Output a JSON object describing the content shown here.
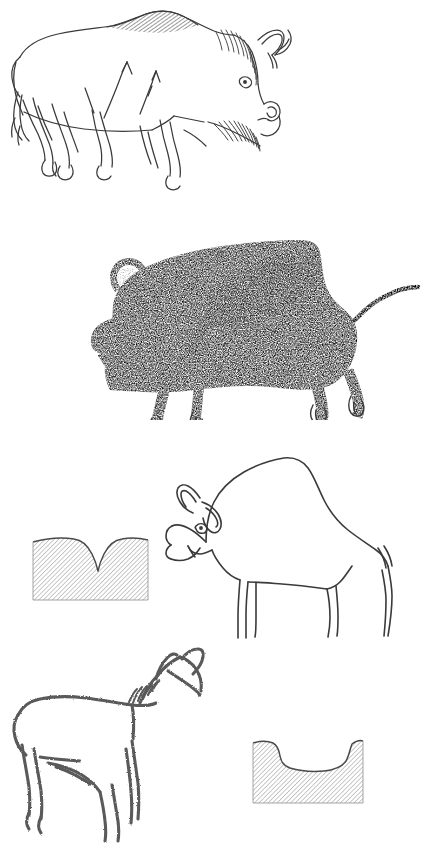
{
  "plate": {
    "title": "Prehistoric cave art engraving plate",
    "background_color": "#ffffff",
    "ink_color": "#3a3a3a",
    "hatch_color": "#8d8d8d",
    "width_px": 430,
    "height_px": 858,
    "figure_count": 4,
    "cross_section_count": 2
  },
  "figures": [
    {
      "id": "figure-1",
      "name": "hatched-bison-facing-right",
      "subject": "bison",
      "orientation": "facing right",
      "technique": "fine line engraving with hatched shading",
      "details": [
        "hatched hump",
        "hatched neck mane",
        "two curved horns",
        "eye",
        "hatched beard",
        "cloven hooves",
        "two arrow marks on flank",
        "short tail"
      ],
      "top_px": 0,
      "height_px": 200
    },
    {
      "id": "figure-2",
      "name": "stippled-bison-facing-left",
      "subject": "bison",
      "orientation": "facing left",
      "technique": "dense stipple / dotted shading with lighter reserved areas",
      "details": [
        "curved loop horn",
        "dark stippled body",
        "light shoulder patch",
        "raised curved tail",
        "four legs with hooves"
      ],
      "top_px": 200,
      "height_px": 220
    },
    {
      "id": "figure-3",
      "name": "outline-bison-facing-left",
      "subject": "bison",
      "orientation": "facing left",
      "technique": "simple contour outline",
      "details": [
        "prominent hump",
        "two horns",
        "eye",
        "muzzle profile",
        "beard line",
        "four straight legs",
        "short tail"
      ],
      "top_px": 430,
      "height_px": 210
    },
    {
      "id": "figure-4",
      "name": "outline-horse-facing-right",
      "subject": "horse or deer",
      "orientation": "facing right",
      "technique": "rough stippled contour outline",
      "details": [
        "raised head",
        "two ear or antler projections",
        "hatched mane",
        "belly line",
        "four legs"
      ],
      "top_px": 645,
      "height_px": 213
    }
  ],
  "cross_sections": [
    {
      "id": "cross-section-1",
      "name": "v-groove-profile",
      "label": "deep narrow V-shaped incision profile",
      "shape": "V",
      "groove_depth": "deep",
      "groove_width": "narrow",
      "fill": "diagonal hatching",
      "paired_with": "figure-3",
      "x_px": 33,
      "y_px": 540,
      "width_px": 115,
      "height_px": 62
    },
    {
      "id": "cross-section-2",
      "name": "u-groove-profile",
      "label": "wide shallow U-shaped incision profile",
      "shape": "U",
      "groove_depth": "shallow",
      "groove_width": "wide",
      "fill": "diagonal hatching",
      "paired_with": "figure-4",
      "x_px": 253,
      "y_px": 743,
      "width_px": 110,
      "height_px": 58
    }
  ]
}
